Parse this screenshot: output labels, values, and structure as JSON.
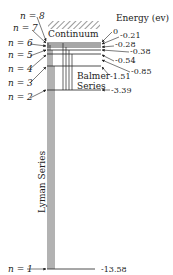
{
  "diagram": {
    "title": "Energy (ev)",
    "continuum_label": "Continuum",
    "series": [
      {
        "name": "Lyman Series",
        "label": "Lyman Series",
        "to_level": 1
      },
      {
        "name": "Balmer Series",
        "label_line1": "Balmer",
        "label_line2": "Series",
        "to_level": 2
      }
    ],
    "levels": [
      {
        "n": 8,
        "label": "n = 8",
        "energy": ""
      },
      {
        "n": 7,
        "label": "n = 7",
        "energy": "0"
      },
      {
        "n": 6,
        "label": "n = 6",
        "energy": "-0.21"
      },
      {
        "n": 5,
        "label": "n = 5",
        "energy": "-0.28"
      },
      {
        "n": 4,
        "label": "n = 4",
        "energy": "-0.38"
      },
      {
        "n": 3,
        "label": "n = 3",
        "energy": "-0.54"
      },
      {
        "n": 2,
        "label": "n = 2",
        "energy": "-3.39"
      },
      {
        "n": 1,
        "label": "n = 1",
        "energy": "-13.58"
      }
    ],
    "energy_labels": [
      "0",
      "-0.21",
      "-0.28",
      "-0.38",
      "-0.54",
      "-0.85",
      "-1.51",
      "-3.39",
      "-13.58"
    ]
  }
}
